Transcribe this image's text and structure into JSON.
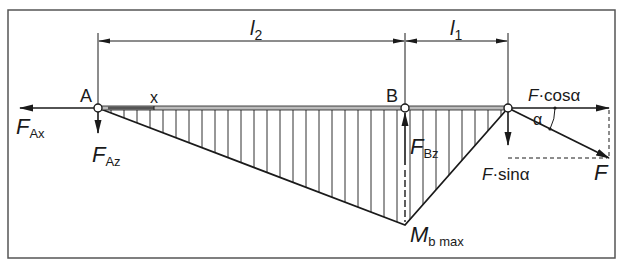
{
  "diagram": {
    "type": "bending-moment-diagram",
    "colors": {
      "line": "#1a1a1a",
      "frame": "#555555",
      "background": "#ffffff"
    },
    "dimensions": {
      "l2": "l",
      "l2_sub": "2",
      "l1": "l",
      "l1_sub": "1"
    },
    "points": {
      "A": "A",
      "B": "B",
      "x": "x"
    },
    "forces": {
      "FAx": {
        "main": "F",
        "sub": "Ax"
      },
      "FAz": {
        "main": "F",
        "sub": "Az"
      },
      "FBz": {
        "main": "F",
        "sub": "Bz"
      },
      "F": {
        "main": "F"
      },
      "Fcos": {
        "main": "F",
        "rest": "·cosα"
      },
      "Fsin": {
        "main": "F",
        "rest": "·sinα"
      }
    },
    "angle": "α",
    "moment": {
      "main": "M",
      "sub": "b max"
    }
  }
}
